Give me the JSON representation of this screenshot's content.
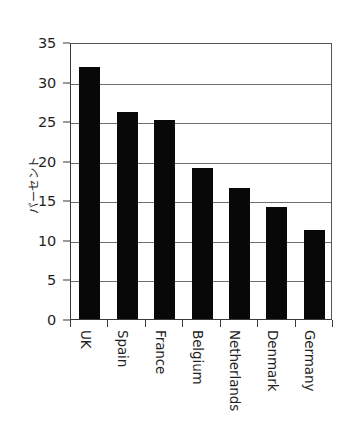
{
  "chart_data": {
    "type": "bar",
    "title": "",
    "subtitle": "",
    "xlabel": "",
    "ylabel": "パーセント",
    "categories": [
      "UK",
      "Spain",
      "France",
      "Belgium",
      "Netherlands",
      "Denmark",
      "Germany"
    ],
    "values": [
      31.9,
      26.1,
      25.1,
      19.1,
      16.6,
      14.2,
      11.2
    ],
    "ylim": [
      0,
      35
    ],
    "ytick_labels": [
      "0",
      "5",
      "10",
      "15",
      "20",
      "25",
      "30",
      "35"
    ],
    "ytick_values": [
      0,
      5,
      10,
      15,
      20,
      25,
      30,
      35
    ],
    "grid": "horizontal",
    "legend": "none",
    "bar_color": "#080808",
    "background_color": "#ffffff",
    "axis_color": "#3a3a3a",
    "gridline_color": "#6e6e6e"
  }
}
